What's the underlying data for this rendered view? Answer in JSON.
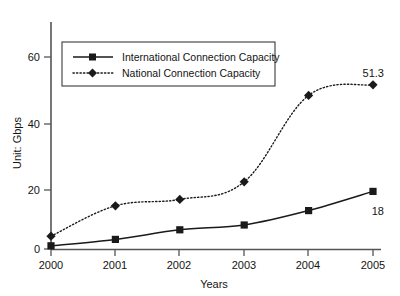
{
  "chart_data": {
    "type": "line",
    "title": "",
    "xlabel": "Years",
    "ylabel": "Unit: Gbps",
    "categories": [
      "2000",
      "2001",
      "2002",
      "2003",
      "2004",
      "2005"
    ],
    "x_ticks": [
      "2000",
      "2001",
      "2002",
      "2003",
      "2004",
      "2005"
    ],
    "y_ticks": [
      "0",
      "20",
      "40",
      "60"
    ],
    "y_tick_values": [
      0,
      20,
      40,
      60
    ],
    "ylim": [
      0,
      68
    ],
    "xlim": [
      2000,
      2005
    ],
    "grid": false,
    "legend_position": "upper-left-inside",
    "series": [
      {
        "name": "International Connection Capacity",
        "marker": "square",
        "line_style": "solid",
        "color": "#1a1a1a",
        "values": [
          1,
          3,
          6,
          7.5,
          12,
          18
        ]
      },
      {
        "name": "National Connection Capacity",
        "marker": "diamond",
        "line_style": "dotted",
        "color": "#1a1a1a",
        "values": [
          4,
          13.5,
          15.5,
          21,
          48,
          51.3
        ]
      }
    ],
    "annotations": [
      {
        "text": "51.3",
        "series": "National Connection Capacity",
        "category": "2005",
        "value": 51.3
      },
      {
        "text": "18",
        "series": "International Connection Capacity",
        "category": "2005",
        "value": 18
      }
    ]
  },
  "legend": {
    "entries": [
      {
        "label": "International Connection Capacity",
        "marker": "square",
        "line_style": "solid"
      },
      {
        "label": "National Connection Capacity",
        "marker": "diamond",
        "line_style": "dotted"
      }
    ]
  },
  "axes": {
    "y_title": "Unit: Gbps",
    "x_title": "Years",
    "y_labels": [
      "60",
      "40",
      "20",
      "0"
    ],
    "x_labels": [
      "2000",
      "2001",
      "2002",
      "2003",
      "2004",
      "2005"
    ]
  },
  "annotations": {
    "national_last": "51.3",
    "international_last": "18"
  },
  "top_edge_ghost": ""
}
